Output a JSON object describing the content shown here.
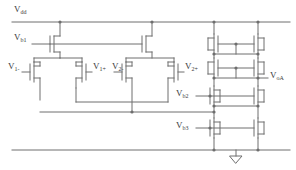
{
  "diagram": {
    "type": "transistor-level circuit schematic",
    "line_color": "#6e6e6e",
    "text_color": "#3a3a3a",
    "background": "#ffffff"
  },
  "labels": {
    "vdd": {
      "base": "V",
      "sub": "dd",
      "x": 14,
      "y": 5
    },
    "vb1": {
      "base": "V",
      "sub": "b1",
      "x": 14,
      "y": 33
    },
    "v1_minus": {
      "base": "V",
      "sub": "1-",
      "x": 14,
      "y": 62
    },
    "v1_plus": {
      "base": "V",
      "sub": "1+",
      "x": 92,
      "y": 62
    },
    "v2_minus": {
      "base": "V",
      "sub": "2-",
      "x": 112,
      "y": 62
    },
    "v2_plus": {
      "base": "V",
      "sub": "2+",
      "x": 185,
      "y": 62
    },
    "voa": {
      "base": "V",
      "sub": "oA",
      "x": 270,
      "y": 78
    },
    "vb2": {
      "base": "V",
      "sub": "b2",
      "x": 176,
      "y": 92
    },
    "vb3": {
      "base": "V",
      "sub": "b3",
      "x": 176,
      "y": 124
    }
  },
  "nets": {
    "supply_rail": "Vdd",
    "ground_rail": "GND",
    "output_node": "VoA"
  },
  "devices": {
    "tail_sources": 2,
    "input_pairs": 2,
    "input_transistors": 4,
    "mirror_stack_rows": 4,
    "mirror_transistors": 8,
    "ground_symbols": 1
  }
}
